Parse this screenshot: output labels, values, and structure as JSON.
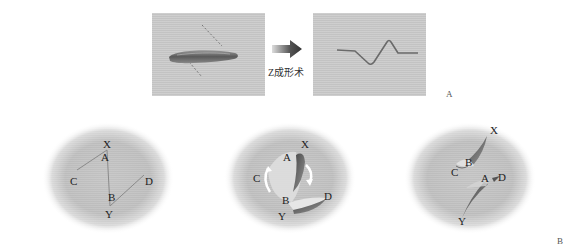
{
  "figure": {
    "part_a": {
      "letter": "A",
      "before_panel": {
        "description": "elongated linear scar with dashed incision lines"
      },
      "arrow_caption": "Z成形术",
      "after_panel": {
        "description": "zig-zag scar after Z-plasty"
      }
    },
    "part_b": {
      "letter": "B",
      "diagrams": [
        {
          "step": 1,
          "description": "incision design",
          "labels": {
            "X": "X",
            "A": "A",
            "C": "C",
            "B": "B",
            "D": "D",
            "Y": "Y"
          }
        },
        {
          "step": 2,
          "description": "flaps raised and transposed",
          "labels": {
            "X": "X",
            "A": "A",
            "C": "C",
            "B": "B",
            "D": "D",
            "Y": "Y"
          }
        },
        {
          "step": 3,
          "description": "flaps sutured in new position",
          "labels": {
            "X": "X",
            "B": "B",
            "C": "C",
            "A": "A",
            "D": "D",
            "Y": "Y"
          }
        }
      ]
    }
  },
  "colors": {
    "photo_bg": "#c9c9c9",
    "scar": "#6a6a6a",
    "oval": "#b8b8b8",
    "line": "#8a8a8a",
    "text": "#222222"
  }
}
